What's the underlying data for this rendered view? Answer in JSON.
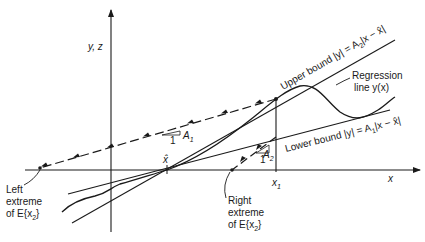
{
  "axes": {
    "y_label": "y, z",
    "x_label": "x"
  },
  "points": {
    "x_hat_label": "x̂",
    "x1_label": "x",
    "x1_sub": "1"
  },
  "upper_bound": {
    "text": "Upper bound |y| = A",
    "sub": "2",
    "tail": "|x − x̂|"
  },
  "lower_bound": {
    "text": "Lower bound |y| = A",
    "sub": "1",
    "tail": "|x − x̂|"
  },
  "regression": {
    "line1": "Regression",
    "line2": "line y(x)"
  },
  "slope_A1": {
    "run": "1",
    "rise": "A",
    "sub": "1"
  },
  "slope_A2": {
    "run": "1",
    "rise": "A",
    "sub": "2"
  },
  "left_extreme": {
    "line1": "Left",
    "line2": "extreme",
    "line3": "of E{x",
    "sub": "2",
    "close": "}"
  },
  "right_extreme": {
    "line1": "Right",
    "line2": "extreme",
    "line3": "of E{x",
    "sub": "2",
    "close": "}"
  },
  "colors": {
    "ink": "#1a1a1a",
    "background": "#ffffff"
  }
}
